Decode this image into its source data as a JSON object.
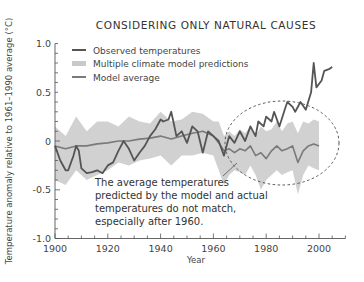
{
  "chart_data": {
    "type": "line",
    "title": "CONSIDERING ONLY NATURAL CAUSES",
    "xlabel": "Year",
    "ylabel": "Temperature anomaly relative to 1961–1990 average (°C)",
    "xlim": [
      1900,
      2010
    ],
    "ylim": [
      -1.0,
      1.0
    ],
    "x_ticks": [
      1900,
      1920,
      1940,
      1960,
      1980,
      2000
    ],
    "y_ticks": [
      1.0,
      0.5,
      0,
      -0.5,
      -1.0
    ],
    "y_tick_labels": [
      "1.0",
      "0.5",
      "0",
      "-0.5",
      "-1.0"
    ],
    "grid": false,
    "legend_position": "upper-left",
    "legend": [
      {
        "label": "Observed temperatures",
        "style": "line",
        "color": "#555555"
      },
      {
        "label": "Multiple climate model predictions",
        "style": "band",
        "color": "#c9c9c9"
      },
      {
        "label": "Model average",
        "style": "line",
        "color": "#7a7a7a"
      }
    ],
    "series": [
      {
        "name": "Observed temperatures",
        "color": "#555555",
        "x": [
          1900,
          1902,
          1904,
          1905,
          1907,
          1908,
          1909,
          1910,
          1912,
          1914,
          1916,
          1918,
          1920,
          1922,
          1924,
          1926,
          1928,
          1930,
          1932,
          1934,
          1936,
          1938,
          1940,
          1941,
          1943,
          1944,
          1945,
          1946,
          1948,
          1950,
          1952,
          1954,
          1956,
          1958,
          1960,
          1962,
          1964,
          1966,
          1968,
          1970,
          1972,
          1974,
          1976,
          1977,
          1979,
          1980,
          1982,
          1983,
          1985,
          1987,
          1988,
          1990,
          1991,
          1993,
          1995,
          1997,
          1998,
          1999,
          2001,
          2002,
          2004,
          2005
        ],
        "values": [
          -0.05,
          -0.2,
          -0.3,
          -0.3,
          -0.15,
          -0.05,
          -0.1,
          -0.28,
          -0.33,
          -0.32,
          -0.3,
          -0.33,
          -0.25,
          -0.22,
          -0.1,
          0.0,
          -0.08,
          -0.2,
          -0.12,
          -0.05,
          0.05,
          0.12,
          0.22,
          0.2,
          0.22,
          0.3,
          0.18,
          0.05,
          0.1,
          -0.02,
          0.15,
          0.1,
          -0.12,
          0.1,
          0.05,
          0.0,
          -0.15,
          0.05,
          -0.02,
          0.1,
          0.0,
          0.15,
          0.05,
          0.2,
          0.15,
          0.25,
          0.2,
          0.3,
          0.15,
          0.32,
          0.4,
          0.35,
          0.3,
          0.4,
          0.32,
          0.5,
          0.8,
          0.55,
          0.62,
          0.72,
          0.74,
          0.76
        ]
      },
      {
        "name": "Model average",
        "color": "#7a7a7a",
        "x": [
          1900,
          1904,
          1908,
          1912,
          1916,
          1920,
          1924,
          1928,
          1932,
          1936,
          1940,
          1944,
          1948,
          1952,
          1956,
          1960,
          1962,
          1964,
          1966,
          1968,
          1970,
          1972,
          1974,
          1976,
          1978,
          1980,
          1982,
          1984,
          1986,
          1988,
          1990,
          1992,
          1994,
          1996,
          1998,
          2000
        ],
        "values": [
          -0.05,
          -0.08,
          -0.05,
          -0.05,
          -0.03,
          -0.02,
          0.0,
          0.0,
          0.02,
          0.03,
          0.05,
          0.02,
          0.05,
          0.08,
          0.1,
          0.05,
          -0.02,
          -0.1,
          -0.08,
          -0.12,
          -0.08,
          -0.1,
          -0.05,
          -0.15,
          -0.12,
          -0.18,
          -0.1,
          -0.05,
          -0.1,
          -0.08,
          -0.05,
          -0.22,
          -0.1,
          -0.05,
          -0.03,
          -0.05
        ]
      },
      {
        "name": "Multiple climate model predictions",
        "type": "band",
        "color": "#c9c9c9",
        "x": [
          1900,
          1904,
          1908,
          1912,
          1916,
          1920,
          1924,
          1928,
          1932,
          1936,
          1940,
          1944,
          1948,
          1952,
          1956,
          1960,
          1962,
          1964,
          1966,
          1968,
          1970,
          1972,
          1974,
          1976,
          1978,
          1980,
          1982,
          1984,
          1986,
          1988,
          1990,
          1992,
          1994,
          1996,
          1998,
          2000
        ],
        "upper": [
          0.15,
          0.05,
          0.25,
          0.1,
          0.2,
          0.2,
          0.15,
          0.25,
          0.2,
          0.18,
          0.3,
          0.2,
          0.22,
          0.3,
          0.28,
          0.2,
          0.2,
          0.05,
          0.1,
          0.05,
          0.12,
          0.08,
          0.15,
          0.05,
          0.15,
          0.1,
          0.12,
          0.2,
          0.1,
          0.18,
          0.2,
          0.08,
          0.2,
          0.18,
          0.22,
          0.2
        ],
        "lower": [
          -0.4,
          -0.45,
          -0.3,
          -0.4,
          -0.35,
          -0.3,
          -0.22,
          -0.25,
          -0.2,
          -0.18,
          -0.15,
          -0.25,
          -0.15,
          -0.15,
          -0.12,
          -0.15,
          -0.3,
          -0.45,
          -0.35,
          -0.3,
          -0.32,
          -0.35,
          -0.25,
          -0.35,
          -0.5,
          -0.4,
          -0.35,
          -0.3,
          -0.35,
          -0.32,
          -0.3,
          -0.55,
          -0.35,
          -0.25,
          -0.28,
          -0.3
        ]
      }
    ],
    "annotations": [
      {
        "text": "The average temperatures predicted by the model and actual temperatures do not match, especially after 1960.",
        "lines": [
          "The average temperatures",
          "predicted by the model and actual",
          "temperatures do not match,",
          "especially after 1960."
        ],
        "highlight": "dashed ellipse around 1965–2010"
      }
    ]
  },
  "labels": {
    "title": "CONSIDERING ONLY NATURAL CAUSES",
    "xlabel": "Year",
    "ylabel": "Temperature anomaly relative to 1961–1990 average (°C)",
    "legend_observed": "Observed temperatures",
    "legend_band": "Multiple climate model predictions",
    "legend_model": "Model average",
    "anno_line1": "The average temperatures",
    "anno_line2": "predicted by the model and actual",
    "anno_line3": "temperatures do not match,",
    "anno_line4": "especially after 1960."
  }
}
